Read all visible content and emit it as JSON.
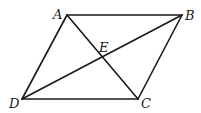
{
  "diagram": {
    "type": "parallelogram-with-diagonals",
    "stroke_color": "#1a1a1a",
    "background": "#ffffff",
    "points": {
      "A": {
        "x": 67,
        "y": 15
      },
      "B": {
        "x": 182,
        "y": 15
      },
      "C": {
        "x": 138,
        "y": 99
      },
      "D": {
        "x": 22,
        "y": 99
      },
      "E": {
        "x": 102,
        "y": 57
      }
    },
    "labels": {
      "A": "A",
      "B": "B",
      "C": "C",
      "D": "D",
      "E": "E"
    },
    "segments": [
      "AB",
      "BC",
      "CD",
      "DA",
      "AC",
      "BD"
    ]
  }
}
